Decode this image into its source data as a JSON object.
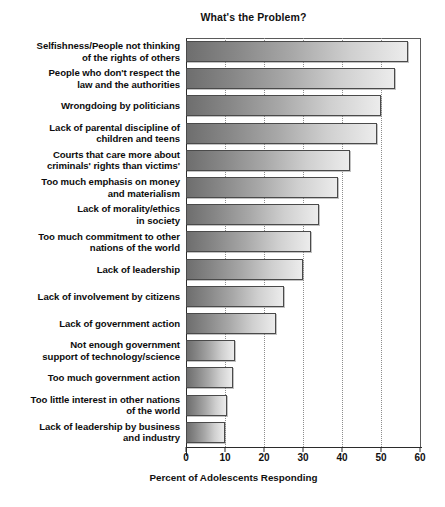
{
  "chart_data": {
    "type": "bar",
    "orientation": "horizontal",
    "title": "What's the Problem?",
    "xlabel": "Percent of Adolescents Responding",
    "ylabel": "",
    "xlim": [
      0,
      60
    ],
    "xticks": [
      0,
      10,
      20,
      30,
      40,
      50,
      60
    ],
    "grid": "vertical-dotted",
    "legend": "none",
    "categories": [
      "Selfishness/People not thinking of the rights of others",
      "People who don't respect the law and the authorities",
      "Wrongdoing by politicians",
      "Lack of parental discipline of children and teens",
      "Courts that care more about criminals' rights than victims'",
      "Too much emphasis on money and materialism",
      "Lack of morality/ethics in society",
      "Too much commitment to other nations of the world",
      "Lack of leadership",
      "Lack of involvement by citizens",
      "Lack of government action",
      "Not enough government support of technology/science",
      "Too much government action",
      "Too little interest in other nations of the world",
      "Lack of leadership by business and industry"
    ],
    "category_lines": [
      [
        "Selfishness/People not thinking",
        "of the rights of others"
      ],
      [
        "People who don't respect the",
        "law and the authorities"
      ],
      [
        "Wrongdoing by politicians"
      ],
      [
        "Lack of parental discipline of",
        "children and teens"
      ],
      [
        "Courts that care more about",
        "criminals' rights than victims'"
      ],
      [
        "Too much emphasis on money",
        "and materialism"
      ],
      [
        "Lack of morality/ethics",
        "in society"
      ],
      [
        "Too much commitment to other",
        "nations of the world"
      ],
      [
        "Lack of leadership"
      ],
      [
        "Lack of involvement by citizens"
      ],
      [
        "Lack of government action"
      ],
      [
        "Not enough government",
        "support of technology/science"
      ],
      [
        "Too much government action"
      ],
      [
        "Too little interest in other nations",
        "of the world"
      ],
      [
        "Lack of leadership by business",
        "and industry"
      ]
    ],
    "values": [
      57,
      53.5,
      50,
      49,
      42,
      39,
      34,
      32,
      30,
      25,
      23,
      12.5,
      12,
      10.5,
      10
    ],
    "bar_style": {
      "gradient_start": "#6e6e6e",
      "gradient_end": "#ececec",
      "border": "#4a4a4a"
    }
  }
}
